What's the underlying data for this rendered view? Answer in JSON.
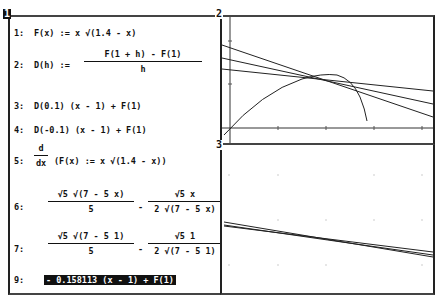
{
  "windows": {
    "algebra": {
      "label": "1"
    },
    "plot2d_a": {
      "label": "2"
    },
    "plot2d_b": {
      "label": "3"
    }
  },
  "algebra": {
    "entries": [
      {
        "num": "1:",
        "text": "F(x) := x √(1.4 - x)"
      },
      {
        "num": "2:",
        "lhs": "D(h) :=",
        "numer": "F(1 + h) - F(1)",
        "denom": "h"
      },
      {
        "num": "3:",
        "text": "D(0.1) (x - 1) + F(1)"
      },
      {
        "num": "4:",
        "text": "D(-0.1) (x - 1) + F(1)"
      },
      {
        "num": "5:",
        "d_numer": "d",
        "d_denom": "dx",
        "text": "(F(x) := x √(1.4 - x))"
      },
      {
        "num": "6:",
        "numer1": "√5 √(7 - 5 x)",
        "denom1": "5",
        "op": "-",
        "numer2": "√5 x",
        "denom2": "2 √(7 - 5 x)"
      },
      {
        "num": "7:",
        "numer1": "√5 √(7 - 5 1)",
        "denom1": "5",
        "op": "-",
        "numer2": "√5 1",
        "denom2": "2 √(7 - 5 1)"
      },
      {
        "num": "9:",
        "text": "- 0.158113 (x - 1) + F(1)",
        "highlighted": true
      }
    ]
  }
}
